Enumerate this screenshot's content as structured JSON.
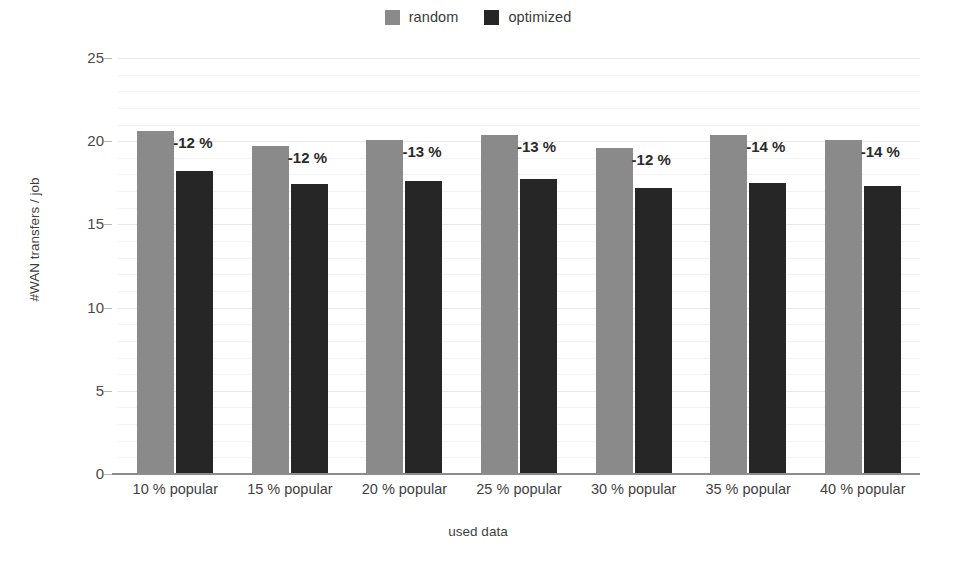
{
  "chart_data": {
    "type": "bar",
    "title": "",
    "xlabel": "used data",
    "ylabel": "#WAN transfers / job",
    "ylim": [
      0,
      25
    ],
    "yticks": [
      0,
      5,
      10,
      15,
      20,
      25
    ],
    "grid": true,
    "legend_position": "top-center",
    "categories": [
      "10 % popular",
      "15 % popular",
      "20 % popular",
      "25 % popular",
      "30 % popular",
      "35 % popular",
      "40 % popular"
    ],
    "series": [
      {
        "name": "random",
        "color": "#8a8a8a",
        "values": [
          20.6,
          19.7,
          20.1,
          20.4,
          19.6,
          20.4,
          20.1
        ]
      },
      {
        "name": "optimized",
        "color": "#262626",
        "values": [
          18.2,
          17.4,
          17.6,
          17.7,
          17.2,
          17.5,
          17.3
        ]
      }
    ],
    "annotations": [
      "-12 %",
      "-12 %",
      "-13 %",
      "-13 %",
      "-12 %",
      "-14 %",
      "-14 %"
    ]
  },
  "legend": {
    "items": [
      {
        "label": "random",
        "color": "#8a8a8a"
      },
      {
        "label": "optimized",
        "color": "#262626"
      }
    ]
  },
  "axes": {
    "y_title": "#WAN transfers / job",
    "x_title": "used data",
    "y_tick_labels": [
      "25",
      "20",
      "15",
      "10",
      "5",
      "0"
    ],
    "x_tick_labels": [
      "10 % popular",
      "15 % popular",
      "20 % popular",
      "25 % popular",
      "30 % popular",
      "35 % popular",
      "40 % popular"
    ]
  },
  "colors": {
    "background": "#ffffff",
    "gridline": "#e9e9e9",
    "axis": "#8c8c8c",
    "text": "#3f3f3f",
    "random": "#8a8a8a",
    "optimized": "#262626"
  }
}
